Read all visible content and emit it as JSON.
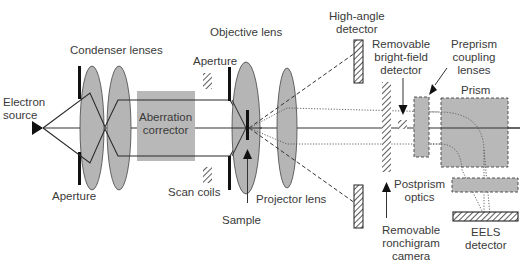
{
  "diagram": {
    "colors": {
      "lens_fill": "#b5b5b5",
      "box_fill": "#b8b8b8",
      "line": "#2a2a2a",
      "text": "#3a3a3a",
      "background": "#ffffff"
    },
    "labels": {
      "electron_source": [
        "Electron",
        "source"
      ],
      "condenser_lenses": "Condenser lenses",
      "aperture_condenser": "Aperture",
      "aberration_corrector": [
        "Aberration",
        "corrector"
      ],
      "aperture_objective": "Aperture",
      "objective_lens": "Objective lens",
      "scan_coils": "Scan coils",
      "sample": "Sample",
      "projector_lens": "Projector lens",
      "high_angle_detector": [
        "High-angle",
        "detector"
      ],
      "bright_field_detector": [
        "Removable",
        "bright-field",
        "detector"
      ],
      "preprism_lenses": [
        "Preprism",
        "coupling",
        "lenses"
      ],
      "prism": "Prism",
      "postprism_optics": [
        "Postprism",
        "optics"
      ],
      "ronchigram_camera": [
        "Removable",
        "ronchigram",
        "camera"
      ],
      "eels_detector": [
        "EELS",
        "detector"
      ]
    }
  }
}
